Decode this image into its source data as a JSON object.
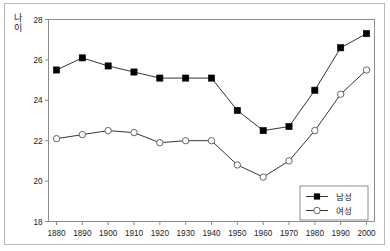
{
  "chart_data": {
    "type": "line",
    "title": "",
    "xlabel": "",
    "ylabel": "나이",
    "xlim": [
      1875,
      2005
    ],
    "ylim": [
      18,
      28
    ],
    "ytick_step": 2,
    "grid": false,
    "legend_position": "bottom-right",
    "categories": [
      1880,
      1890,
      1900,
      1910,
      1920,
      1930,
      1940,
      1950,
      1960,
      1970,
      1980,
      1990,
      2000
    ],
    "xticklabels": [
      "1880",
      "1890",
      "1900",
      "1910",
      "1920",
      "1930",
      "1940",
      "1950",
      "1960",
      "1970",
      "1980",
      "1990",
      "2000"
    ],
    "yticklabels": [
      "18",
      "20",
      "22",
      "24",
      "26",
      "28"
    ],
    "yticks": [
      18,
      20,
      22,
      24,
      26,
      28
    ],
    "series": [
      {
        "name": "남성",
        "marker": "filled-square",
        "color": "#000000",
        "values": [
          25.5,
          26.1,
          25.7,
          25.4,
          25.1,
          25.1,
          25.1,
          23.5,
          22.5,
          22.7,
          24.5,
          26.6,
          27.3
        ]
      },
      {
        "name": "여성",
        "marker": "open-circle",
        "color": "#000000",
        "values": [
          22.1,
          22.3,
          22.5,
          22.4,
          21.9,
          22.0,
          22.0,
          20.8,
          20.2,
          21.0,
          22.5,
          24.3,
          25.5
        ]
      }
    ]
  },
  "legend": {
    "entries": [
      {
        "label": "남성",
        "marker": "filled-square"
      },
      {
        "label": "여성",
        "marker": "open-circle"
      }
    ]
  },
  "axis": {
    "y_title": "나이",
    "y_title_chars": [
      "나",
      "이"
    ]
  }
}
